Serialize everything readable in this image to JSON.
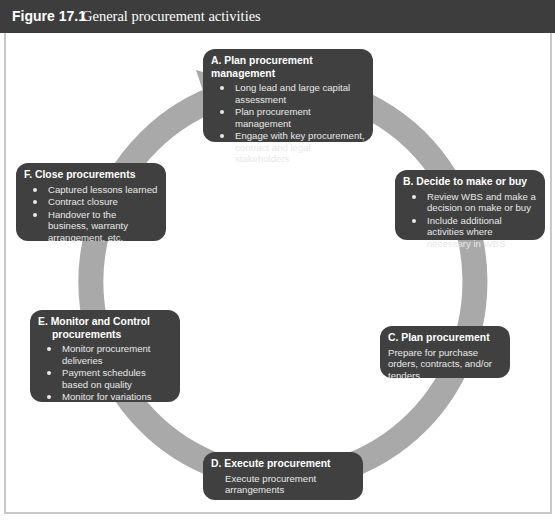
{
  "figure": {
    "label": "Figure 17.1",
    "title": "General procurement activities"
  },
  "colors": {
    "header_bg": "#3d3d3d",
    "box_bg": "#404040",
    "ring": "#a9a9a9",
    "frame_border": "#c8c8c8"
  },
  "steps": [
    {
      "id": "A",
      "title": "A. Plan procurement management",
      "bullets": [
        "Long lead and large capital assessment",
        "Plan procurement management",
        "Engage with key procurement, contract and legal stakeholders"
      ]
    },
    {
      "id": "B",
      "title": "B. Decide to make or buy",
      "bullets": [
        "Review WBS and make a decision on make or buy",
        "Include additional activities where necessary in WBS"
      ]
    },
    {
      "id": "C",
      "title": "C. Plan procurement",
      "description": "Prepare for purchase orders, contracts, and/or tenders"
    },
    {
      "id": "D",
      "title": "D. Execute procurement",
      "description": "Execute procurement arrangements"
    },
    {
      "id": "E",
      "title_line1": "E. Monitor and Control",
      "title_line2": "procurements",
      "bullets": [
        "Monitor procurement deliveries",
        "Payment schedules based on quality",
        "Monitor for variations"
      ]
    },
    {
      "id": "F",
      "title": "F. Close procurements",
      "bullets": [
        "Captured lessons learned",
        "Contract closure",
        "Handover to the business, warranty arrangement, etc."
      ]
    }
  ],
  "flow": {
    "direction": "clockwise",
    "order": [
      "A",
      "B",
      "C",
      "D",
      "E",
      "F",
      "A"
    ]
  }
}
